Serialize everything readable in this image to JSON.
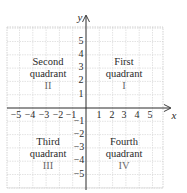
{
  "diagram": {
    "title": "",
    "type": "coordinate-plane",
    "colors": {
      "axis": "#2a2a2a",
      "grid_major": "#c8c8c8",
      "grid_minor": "#dcdcdc",
      "text": "#2a2a2a",
      "roman": "#6a6a6a"
    },
    "axes": {
      "x_label": "x",
      "y_label": "y",
      "x_ticks": [
        "−5",
        "−4",
        "−3",
        "−2",
        "−1",
        "1",
        "2",
        "3",
        "4",
        "5"
      ],
      "y_ticks_positive": [
        "5",
        "4",
        "3",
        "2",
        "1"
      ],
      "y_ticks_negative": [
        "−1",
        "−2",
        "−3",
        "−4",
        "−5"
      ],
      "range": [
        -5,
        5
      ]
    },
    "quadrants": [
      {
        "id": "II",
        "line1": "Second",
        "line2": "quadrant",
        "roman": "II"
      },
      {
        "id": "I",
        "line1": "First",
        "line2": "quadrant",
        "roman": "I"
      },
      {
        "id": "III",
        "line1": "Third",
        "line2": "quadrant",
        "roman": "III"
      },
      {
        "id": "IV",
        "line1": "Fourth",
        "line2": "quadrant",
        "roman": "IV"
      }
    ]
  }
}
